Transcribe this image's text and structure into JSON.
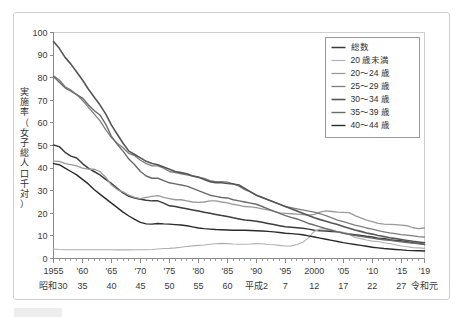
{
  "chart_data": {
    "type": "line",
    "title": "",
    "ylabel": "実施率（女子総人口千対）",
    "xlabel": "",
    "ylim": [
      0,
      100
    ],
    "ytick_step": 10,
    "yticks": [
      0,
      10,
      20,
      30,
      40,
      50,
      60,
      70,
      80,
      90,
      100
    ],
    "xlim": [
      1955,
      2019
    ],
    "xtick_labels": [
      "1955",
      "'60",
      "'65",
      "'70",
      "'75",
      "'80",
      "'85",
      "'90",
      "'95",
      "2000",
      "'05",
      "'10",
      "'15",
      "'19"
    ],
    "xtick_values": [
      1955,
      1960,
      1965,
      1970,
      1975,
      1980,
      1985,
      1990,
      1995,
      2000,
      2005,
      2010,
      2015,
      2019
    ],
    "era_labels": [
      "昭和30",
      "35",
      "40",
      "45",
      "50",
      "55",
      "60",
      "平成2",
      "7",
      "12",
      "17",
      "22",
      "27",
      "令和元"
    ],
    "grid": false,
    "legend_position": "top-right",
    "x": [
      1955,
      1956,
      1957,
      1958,
      1959,
      1960,
      1961,
      1962,
      1963,
      1964,
      1965,
      1966,
      1967,
      1968,
      1969,
      1970,
      1971,
      1972,
      1973,
      1974,
      1975,
      1976,
      1977,
      1978,
      1979,
      1980,
      1981,
      1982,
      1983,
      1984,
      1985,
      1986,
      1987,
      1988,
      1989,
      1990,
      1991,
      1992,
      1993,
      1994,
      1995,
      1996,
      1997,
      1998,
      1999,
      2000,
      2001,
      2002,
      2003,
      2004,
      2005,
      2006,
      2007,
      2008,
      2009,
      2010,
      2011,
      2012,
      2013,
      2014,
      2015,
      2016,
      2017,
      2018,
      2019
    ],
    "series": [
      {
        "name": "総数",
        "color": "#3c3c3c",
        "width": 1.5,
        "values": [
          50.2,
          49.5,
          47.0,
          45.3,
          44.5,
          42.0,
          40.0,
          38.5,
          37.0,
          35.0,
          33.2,
          31.0,
          29.0,
          27.5,
          26.8,
          26.2,
          25.8,
          25.5,
          25.5,
          24.5,
          23.3,
          23.0,
          22.5,
          22.0,
          21.5,
          21.0,
          20.5,
          20.0,
          19.5,
          19.0,
          18.6,
          18.0,
          17.5,
          17.0,
          16.8,
          16.5,
          16.0,
          15.5,
          15.0,
          14.5,
          14.0,
          13.8,
          13.6,
          13.4,
          13.0,
          12.5,
          12.3,
          12.2,
          12.0,
          11.8,
          11.3,
          10.8,
          10.5,
          10.2,
          9.8,
          9.5,
          9.0,
          8.8,
          8.3,
          8.0,
          7.8,
          7.4,
          7.0,
          6.8,
          6.2
        ]
      },
      {
        "name": "20 歳未満",
        "color": "#b0b0b0",
        "width": 1.1,
        "values": [
          4.2,
          4.0,
          3.9,
          3.9,
          3.9,
          3.9,
          3.9,
          3.9,
          3.9,
          3.9,
          3.9,
          3.8,
          3.8,
          3.8,
          3.9,
          3.9,
          3.9,
          4.0,
          4.2,
          4.4,
          4.5,
          4.7,
          5.0,
          5.3,
          5.6,
          5.8,
          6.0,
          6.3,
          6.5,
          6.7,
          6.6,
          6.4,
          6.3,
          6.3,
          6.4,
          6.6,
          6.5,
          6.2,
          6.1,
          5.8,
          5.5,
          5.6,
          6.2,
          7.2,
          9.1,
          12.1,
          13.0,
          13.2,
          12.8,
          11.8,
          11.6,
          10.6,
          9.3,
          8.8,
          8.2,
          7.7,
          7.5,
          7.0,
          6.6,
          6.1,
          5.5,
          5.2,
          4.8,
          4.7,
          4.5
        ]
      },
      {
        "name": "20～24 歳",
        "color": "#9a9a9a",
        "width": 1.3,
        "values": [
          43.1,
          43.0,
          42.0,
          41.5,
          41.0,
          40.0,
          39.5,
          39.5,
          38.5,
          36.0,
          32.5,
          30.5,
          29.5,
          28.0,
          27.0,
          26.5,
          27.0,
          27.5,
          27.8,
          27.0,
          26.5,
          26.0,
          26.0,
          25.5,
          25.0,
          24.8,
          25.0,
          25.5,
          25.5,
          25.0,
          24.6,
          24.0,
          23.5,
          23.0,
          22.8,
          22.5,
          22.0,
          21.5,
          20.8,
          20.2,
          20.0,
          19.8,
          19.6,
          19.4,
          19.2,
          19.5,
          20.5,
          21.1,
          20.8,
          20.5,
          20.4,
          20.3,
          19.0,
          18.0,
          17.0,
          16.3,
          15.5,
          15.2,
          15.1,
          15.0,
          14.8,
          14.5,
          13.6,
          13.2,
          13.5
        ]
      },
      {
        "name": "25～29 歳",
        "color": "#7e7e7e",
        "width": 1.3,
        "values": [
          80.8,
          79.0,
          76.0,
          74.5,
          72.5,
          70.0,
          67.0,
          64.0,
          61.0,
          57.0,
          53.5,
          51.0,
          49.0,
          46.5,
          45.5,
          43.5,
          42.0,
          41.0,
          41.0,
          40.0,
          38.5,
          38.0,
          37.5,
          37.0,
          36.5,
          36.0,
          35.5,
          34.5,
          34.0,
          34.0,
          33.8,
          33.0,
          32.0,
          30.5,
          29.5,
          28.0,
          27.0,
          26.0,
          25.0,
          24.0,
          23.0,
          22.5,
          22.0,
          21.5,
          21.0,
          20.5,
          19.8,
          19.0,
          18.0,
          17.0,
          16.3,
          15.5,
          14.8,
          14.2,
          13.5,
          13.0,
          12.3,
          11.8,
          11.3,
          11.0,
          10.6,
          10.3,
          10.0,
          9.7,
          9.5
        ]
      },
      {
        "name": "30～34 歳",
        "color": "#555555",
        "width": 1.6,
        "values": [
          96.0,
          93.0,
          89.0,
          86.0,
          82.5,
          79.0,
          75.0,
          71.5,
          68.0,
          64.0,
          59.0,
          55.0,
          51.0,
          47.5,
          46.0,
          44.5,
          43.0,
          42.0,
          41.5,
          40.5,
          39.5,
          38.5,
          38.0,
          37.5,
          36.5,
          36.0,
          35.0,
          34.0,
          33.5,
          33.5,
          33.2,
          33.0,
          32.5,
          31.0,
          29.5,
          28.0,
          27.0,
          26.0,
          25.0,
          24.0,
          23.0,
          22.0,
          21.0,
          20.0,
          19.0,
          18.0,
          17.2,
          16.5,
          15.7,
          15.0,
          14.2,
          13.4,
          12.6,
          12.0,
          11.3,
          10.8,
          10.2,
          9.7,
          9.2,
          8.8,
          8.4,
          8.0,
          7.6,
          7.3,
          7.0
        ]
      },
      {
        "name": "35～39 歳",
        "color": "#6a6a6a",
        "width": 1.4,
        "values": [
          80.5,
          78.0,
          75.5,
          74.0,
          72.5,
          71.0,
          68.0,
          65.5,
          63.5,
          59.5,
          54.0,
          50.5,
          47.5,
          44.0,
          41.5,
          38.5,
          36.5,
          35.5,
          35.5,
          34.5,
          33.5,
          33.0,
          32.5,
          32.0,
          31.0,
          30.0,
          29.0,
          28.0,
          27.5,
          27.0,
          26.8,
          26.0,
          25.5,
          25.0,
          24.5,
          24.0,
          23.0,
          22.0,
          21.0,
          20.0,
          19.0,
          18.2,
          17.5,
          16.5,
          15.5,
          14.8,
          14.0,
          13.2,
          12.4,
          11.8,
          11.2,
          10.7,
          10.2,
          9.8,
          9.4,
          9.0,
          8.6,
          8.3,
          8.0,
          7.7,
          7.4,
          7.1,
          6.8,
          6.5,
          6.3
        ]
      },
      {
        "name": "40～44 歳",
        "color": "#2b2b2b",
        "width": 1.4,
        "values": [
          42.0,
          41.5,
          40.0,
          38.5,
          37.0,
          35.0,
          33.0,
          30.5,
          28.5,
          26.5,
          24.5,
          22.5,
          20.5,
          18.8,
          17.3,
          16.0,
          15.3,
          15.2,
          15.5,
          15.3,
          15.2,
          15.0,
          14.8,
          14.5,
          14.0,
          13.5,
          13.2,
          13.0,
          12.8,
          12.7,
          12.6,
          12.5,
          12.5,
          12.5,
          12.4,
          12.3,
          12.2,
          12.0,
          11.8,
          11.5,
          11.2,
          11.0,
          10.8,
          10.5,
          10.0,
          9.5,
          9.0,
          8.5,
          8.0,
          7.5,
          7.0,
          6.6,
          6.2,
          5.8,
          5.4,
          5.0,
          4.7,
          4.4,
          4.2,
          4.0,
          3.8,
          3.6,
          3.5,
          3.4,
          3.3
        ]
      }
    ]
  },
  "legend": {
    "items": [
      {
        "label": "総数"
      },
      {
        "label": "20 歳未満"
      },
      {
        "label": "20～24 歳"
      },
      {
        "label": "25～29 歳"
      },
      {
        "label": "30～34 歳"
      },
      {
        "label": "35～39 歳"
      },
      {
        "label": "40～44 歳"
      }
    ]
  },
  "axes": {
    "y_title": "実施率（女子総人口千対）",
    "y_title_chars": [
      "実",
      "施",
      "率",
      "（",
      "女",
      "子",
      "総",
      "人",
      "口",
      "千",
      "対",
      "）"
    ]
  },
  "colors": {
    "frame": "#d2d2d2",
    "axis": "#8a8a8a",
    "text": "#2e2e2e",
    "background": "#ffffff"
  }
}
